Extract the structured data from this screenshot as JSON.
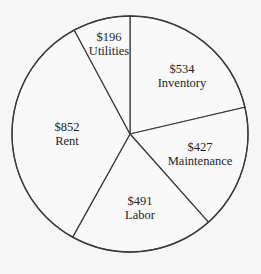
{
  "chart_data": {
    "type": "pie",
    "title": "",
    "start_angle_deg": 0,
    "direction": "clockwise",
    "categories": [
      "Inventory",
      "Maintenance",
      "Labor",
      "Rent",
      "Utilities"
    ],
    "values": [
      534,
      427,
      491,
      852,
      196
    ],
    "value_labels": [
      "$534",
      "$427",
      "$491",
      "$852",
      "$196"
    ],
    "total": 2500,
    "legend": "none",
    "colors": {
      "fill": "#f9f9f9",
      "stroke": "#3a3a3a",
      "text": "#1e1e1e",
      "background": "#f6f6f6"
    }
  }
}
